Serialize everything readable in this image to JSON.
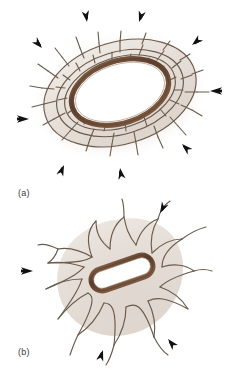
{
  "figure": {
    "caption_style": "panel-letters",
    "background_color": "#ffffff"
  },
  "colors": {
    "cell_fill": "#e9e3dd",
    "cell_border": "#6b5a4a",
    "ring_outline": "#6b4a35",
    "ring_highlight": "#8d6a4f",
    "lumen_fill": "#ffffff",
    "halo": "#d9cec6",
    "arrow": "#111111",
    "label_text": "#3a3a3a"
  },
  "panels": [
    {
      "id": "panel-a",
      "label": "(a)",
      "structure_name": "epithelial-lumen-ring",
      "description_shape": "oval ring with concentric cobblestone cell mosaic",
      "ring": {
        "shape": "ellipse",
        "cx": 120,
        "cy": 92,
        "rx": 50,
        "ry": 31,
        "rotation_deg": -18,
        "stroke_width": 5
      },
      "cell_rings": 3,
      "cell_count_approx": 46,
      "arrows": [
        {
          "name": "arrow-up-left-outer",
          "x": 42,
          "y": 48,
          "angle_deg": -135,
          "length": 17
        },
        {
          "name": "arrow-up-left-inner",
          "x": 87,
          "y": 22,
          "angle_deg": -100,
          "length": 17
        },
        {
          "name": "arrow-up-right-inner",
          "x": 137,
          "y": 22,
          "angle_deg": -72,
          "length": 17
        },
        {
          "name": "arrow-up-right-outer",
          "x": 190,
          "y": 45,
          "angle_deg": -40,
          "length": 17
        },
        {
          "name": "arrow-right",
          "x": 209,
          "y": 91,
          "angle_deg": 0,
          "length": 18
        },
        {
          "name": "arrow-left",
          "x": 30,
          "y": 119,
          "angle_deg": 180,
          "length": 18
        },
        {
          "name": "arrow-down-right",
          "x": 180,
          "y": 143,
          "angle_deg": 42,
          "length": 17
        },
        {
          "name": "arrow-down-left",
          "x": 65,
          "y": 163,
          "angle_deg": 110,
          "length": 17
        },
        {
          "name": "arrow-down",
          "x": 118,
          "y": 166,
          "angle_deg": 78,
          "length": 17
        }
      ]
    },
    {
      "id": "panel-b",
      "label": "(b)",
      "structure_name": "bacillus-rod-cell",
      "description_shape": "elongated rod with surrounding stellate cells",
      "rod": {
        "shape": "capsule",
        "cx": 122,
        "cy": 78,
        "half_length": 32,
        "radius": 11,
        "rotation_deg": -19,
        "stroke_width": 5
      },
      "cell_count_approx": 12,
      "arrows": [
        {
          "name": "arrow-up-right",
          "x": 158,
          "y": 20,
          "angle_deg": -62,
          "length": 17
        },
        {
          "name": "arrow-left",
          "x": 34,
          "y": 77,
          "angle_deg": 180,
          "length": 18
        },
        {
          "name": "arrow-down-left",
          "x": 104,
          "y": 152,
          "angle_deg": 105,
          "length": 17
        },
        {
          "name": "arrow-down-right",
          "x": 166,
          "y": 141,
          "angle_deg": 50,
          "length": 17
        }
      ]
    }
  ]
}
